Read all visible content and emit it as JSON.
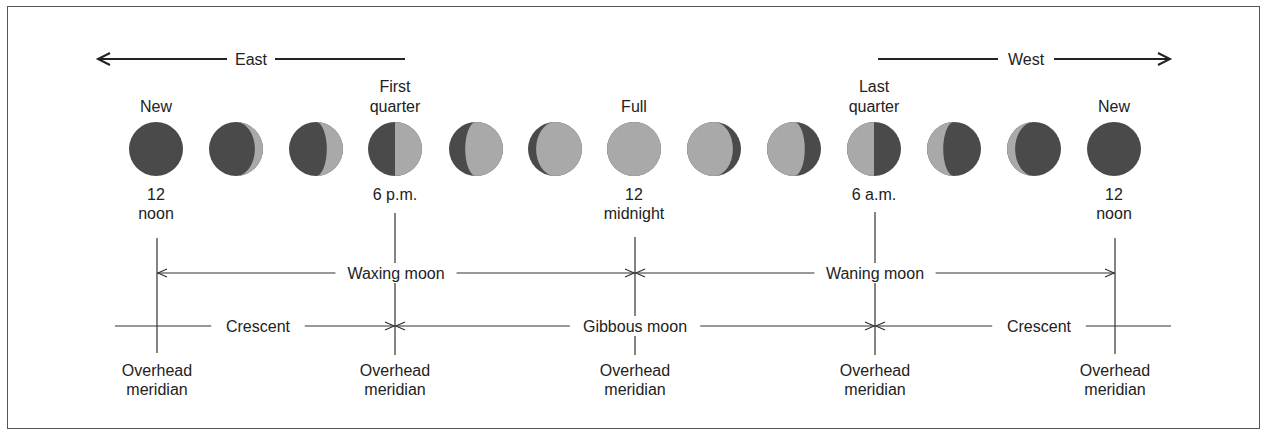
{
  "colors": {
    "dark": "#4a4a4a",
    "light": "#a9a9a9",
    "ink": "#222222"
  },
  "directions": {
    "east": {
      "label": "East",
      "from": 405,
      "to": 98,
      "y": 59,
      "text_x": 251
    },
    "west": {
      "label": "West",
      "from": 878,
      "to": 1170,
      "y": 59,
      "text_x": 1026
    }
  },
  "moons": {
    "y": 149,
    "r": 27,
    "phases": [
      {
        "x": 156,
        "lit": 0,
        "side": "right",
        "top_label": [
          "New"
        ]
      },
      {
        "x": 236,
        "lit": 0.15,
        "side": "right"
      },
      {
        "x": 316,
        "lit": 0.3,
        "side": "right"
      },
      {
        "x": 395,
        "lit": 0.5,
        "side": "right",
        "top_label": [
          "First",
          "quarter"
        ]
      },
      {
        "x": 476,
        "lit": 0.7,
        "side": "right"
      },
      {
        "x": 555,
        "lit": 0.85,
        "side": "right"
      },
      {
        "x": 634,
        "lit": 1,
        "side": "right",
        "top_label": [
          "Full"
        ]
      },
      {
        "x": 714,
        "lit": 0.85,
        "side": "left"
      },
      {
        "x": 794,
        "lit": 0.7,
        "side": "left"
      },
      {
        "x": 874,
        "lit": 0.5,
        "side": "left",
        "top_label": [
          "Last",
          "quarter"
        ]
      },
      {
        "x": 954,
        "lit": 0.3,
        "side": "left"
      },
      {
        "x": 1034,
        "lit": 0.15,
        "side": "left"
      },
      {
        "x": 1114,
        "lit": 0,
        "side": "left",
        "top_label": [
          "New"
        ]
      }
    ]
  },
  "times": [
    {
      "x": 156,
      "lines": [
        "12",
        "noon"
      ]
    },
    {
      "x": 395,
      "lines": [
        "6 p.m."
      ]
    },
    {
      "x": 634,
      "lines": [
        "12",
        "midnight"
      ]
    },
    {
      "x": 874,
      "lines": [
        "6 a.m."
      ]
    },
    {
      "x": 1114,
      "lines": [
        "12",
        "noon"
      ]
    }
  ],
  "meridians": [
    {
      "x": 157,
      "y1": 238,
      "y2": 353
    },
    {
      "x": 395,
      "y1": 213,
      "y2": 355
    },
    {
      "x": 635,
      "y1": 237,
      "y2": 355
    },
    {
      "x": 875,
      "y1": 212,
      "y2": 355
    },
    {
      "x": 1115,
      "y1": 238,
      "y2": 354
    }
  ],
  "meridian_label": [
    "Overhead",
    "meridian"
  ],
  "spans": {
    "waxing": {
      "label": "Waxing moon",
      "x1": 157,
      "x2": 635,
      "y": 273,
      "text_x": 396
    },
    "waning": {
      "label": "Waning moon",
      "x1": 635,
      "x2": 1115,
      "y": 273,
      "text_x": 875
    },
    "crescent_left": {
      "label": "Crescent",
      "x1": 115,
      "x2": 395,
      "y": 326,
      "text_x": 258,
      "arrow_start": false
    },
    "gibbous": {
      "label": "Gibbous moon",
      "x1": 395,
      "x2": 875,
      "y": 326,
      "text_x": 635
    },
    "crescent_right": {
      "label": "Crescent",
      "x1": 875,
      "x2": 1171,
      "y": 326,
      "text_x": 1039,
      "arrow_end": false
    }
  }
}
